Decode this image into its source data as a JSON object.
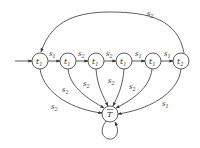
{
  "diagram": {
    "type": "state-machine",
    "states": [
      {
        "id": "q0",
        "label": "t",
        "sub": "1",
        "x": 40,
        "y": 61
      },
      {
        "id": "q1",
        "label": "t",
        "sub": "1",
        "x": 68,
        "y": 61
      },
      {
        "id": "q2",
        "label": "t",
        "sub": "1",
        "x": 96,
        "y": 61
      },
      {
        "id": "q3",
        "label": "t",
        "sub": "1",
        "x": 124,
        "y": 61
      },
      {
        "id": "q4",
        "label": "t",
        "sub": "1",
        "x": 153,
        "y": 61
      },
      {
        "id": "q5",
        "label": "t",
        "sub": "2",
        "x": 181,
        "y": 61
      },
      {
        "id": "sink",
        "label": "T",
        "sub": "",
        "overbar": true,
        "x": 110,
        "y": 114
      }
    ],
    "start_state": "q0",
    "transitions": [
      {
        "from": "q0",
        "to": "q1",
        "label": "s",
        "sub": "1"
      },
      {
        "from": "q1",
        "to": "q2",
        "label": "s",
        "sub": "2"
      },
      {
        "from": "q2",
        "to": "q3",
        "label": "s",
        "sub": "2"
      },
      {
        "from": "q3",
        "to": "q4",
        "label": "s",
        "sub": "1"
      },
      {
        "from": "q4",
        "to": "q5",
        "label": "s",
        "sub": "1"
      },
      {
        "from": "q5",
        "to": "q0",
        "label": "s",
        "sub": "2"
      },
      {
        "from": "q0",
        "to": "sink",
        "label": "s",
        "sub": "2"
      },
      {
        "from": "q1",
        "to": "sink",
        "label": "s",
        "sub": "2"
      },
      {
        "from": "q2",
        "to": "sink",
        "label": "s",
        "sub": "2"
      },
      {
        "from": "q3",
        "to": "sink",
        "label": "s",
        "sub": "2"
      },
      {
        "from": "q4",
        "to": "sink",
        "label": "s",
        "sub": "2"
      },
      {
        "from": "q5",
        "to": "sink",
        "label": "s",
        "sub": "1"
      },
      {
        "from": "sink",
        "to": "sink",
        "label": "",
        "sub": ""
      }
    ],
    "edge_labels": {
      "q0_q1": "s1",
      "q1_q2": "s2",
      "q2_q3": "s2",
      "q3_q4": "s1",
      "q4_q5": "s1",
      "q5_q0": "s2",
      "q0_sink": "s2",
      "q1_sink": "s2",
      "q2_sink": "s2",
      "q3_sink": "s2",
      "q4_sink": "s2",
      "q5_sink": "s1"
    }
  }
}
